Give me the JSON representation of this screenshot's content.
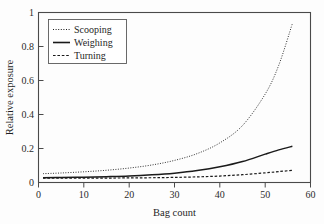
{
  "chart_data": {
    "type": "line",
    "title": "",
    "xlabel": "Bag count",
    "ylabel": "Relative exposure",
    "xlim": [
      0,
      60
    ],
    "ylim": [
      0,
      1
    ],
    "xticks": [
      0,
      10,
      20,
      30,
      40,
      50,
      60
    ],
    "yticks": [
      0,
      0.2,
      0.4,
      0.6,
      0.8,
      1
    ],
    "xtick_labels": [
      "0",
      "10",
      "20",
      "30",
      "40",
      "50",
      "60"
    ],
    "ytick_labels": [
      "0",
      "0.2",
      "0.4",
      "0.6",
      "0.8",
      "1"
    ],
    "grid": false,
    "legend_position": "upper-left",
    "x": [
      1,
      5,
      10,
      15,
      20,
      25,
      30,
      35,
      40,
      45,
      50,
      53,
      56
    ],
    "series": [
      {
        "name": "Scooping",
        "style": "dotted",
        "values": [
          0.052,
          0.056,
          0.063,
          0.072,
          0.085,
          0.103,
          0.13,
          0.17,
          0.233,
          0.335,
          0.52,
          0.69,
          0.935
        ]
      },
      {
        "name": "Weighing",
        "style": "solid",
        "values": [
          0.028,
          0.029,
          0.031,
          0.034,
          0.038,
          0.045,
          0.055,
          0.07,
          0.092,
          0.123,
          0.167,
          0.192,
          0.213
        ]
      },
      {
        "name": "Turning",
        "style": "dashed",
        "values": [
          0.026,
          0.026,
          0.026,
          0.026,
          0.027,
          0.028,
          0.03,
          0.033,
          0.038,
          0.046,
          0.057,
          0.064,
          0.072
        ]
      }
    ]
  },
  "legend": {
    "items": [
      {
        "label": "Scooping",
        "style": "dotted"
      },
      {
        "label": "Weighing",
        "style": "solid"
      },
      {
        "label": "Turning",
        "style": "dashed"
      }
    ]
  },
  "colors": {
    "line": "#1a1a1a",
    "frame": "#4a4a4a",
    "text": "#1f1f1f",
    "background": "#fdfdfd"
  }
}
